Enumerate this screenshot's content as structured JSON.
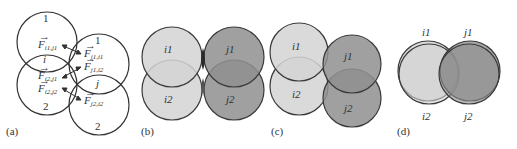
{
  "panels": [
    {
      "id": "a",
      "label": "(a)",
      "circles": [
        {
          "name": "i1",
          "top_label": "1"
        },
        {
          "name": "i2",
          "bottom_label": "2"
        },
        {
          "name": "j1",
          "top_label": "1"
        },
        {
          "name": "j2",
          "bottom_label": "2"
        }
      ],
      "group_labels": {
        "i": "i",
        "j": "j"
      },
      "forces": {
        "f_i1_j1": {
          "base": "F",
          "sub": "i1,j1"
        },
        "f_j1_i1": {
          "base": "F",
          "sub": "j1,i1"
        },
        "f_i2_j1": {
          "base": "F",
          "sub": "i2,j1"
        },
        "f_j1_i2": {
          "base": "F",
          "sub": "j1,i2"
        },
        "f_i2_j2": {
          "base": "F",
          "sub": "i2,j2"
        },
        "f_j2_i2": {
          "base": "F",
          "sub": "j2,i2"
        }
      }
    },
    {
      "id": "b",
      "label": "(b)",
      "circle_labels": [
        "i1",
        "j1",
        "i2",
        "j2"
      ]
    },
    {
      "id": "c",
      "label": "(c)",
      "circle_labels": [
        "i1",
        "j1",
        "i2",
        "j2"
      ]
    },
    {
      "id": "d",
      "label": "(d)",
      "circle_labels": [
        "i1",
        "j1",
        "i2",
        "j2"
      ]
    }
  ],
  "colors": {
    "light_fill": "#d4d4d4",
    "dark_fill": "#8f8f8f",
    "overlap_fill": "#3a3a3a",
    "stroke": "#3a3a3a"
  }
}
